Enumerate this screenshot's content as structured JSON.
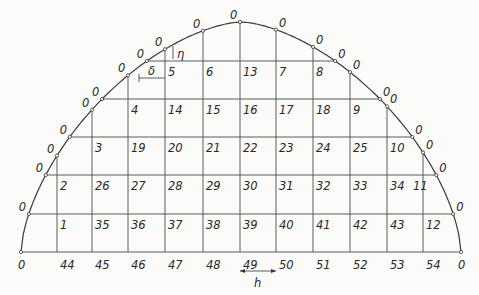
{
  "diagram": {
    "type": "grid-in-semi-elliptical-domain",
    "dimension_labels": {
      "horizontal_spacing": "h",
      "boundary_offset_x": "δ",
      "boundary_offset_y": "η"
    },
    "boundary_value": "0",
    "columns_x": [
      57,
      92,
      128,
      165,
      203,
      240,
      276,
      313,
      350,
      387,
      423
    ],
    "rows_y": [
      61,
      99,
      137,
      175,
      214,
      252
    ],
    "interior_rows": [
      {
        "y": 61,
        "labels": [
          {
            "x": 165,
            "t": "5"
          },
          {
            "x": 203,
            "t": "6"
          },
          {
            "x": 240,
            "t": "13"
          },
          {
            "x": 276,
            "t": "7"
          },
          {
            "x": 313,
            "t": "8"
          }
        ]
      },
      {
        "y": 99,
        "labels": [
          {
            "x": 128,
            "t": "4"
          },
          {
            "x": 165,
            "t": "14"
          },
          {
            "x": 203,
            "t": "15"
          },
          {
            "x": 240,
            "t": "16"
          },
          {
            "x": 276,
            "t": "17"
          },
          {
            "x": 313,
            "t": "18"
          },
          {
            "x": 350,
            "t": "9"
          }
        ]
      },
      {
        "y": 137,
        "labels": [
          {
            "x": 92,
            "t": "3"
          },
          {
            "x": 128,
            "t": "19"
          },
          {
            "x": 165,
            "t": "20"
          },
          {
            "x": 203,
            "t": "21"
          },
          {
            "x": 240,
            "t": "22"
          },
          {
            "x": 276,
            "t": "23"
          },
          {
            "x": 313,
            "t": "24"
          },
          {
            "x": 350,
            "t": "25"
          },
          {
            "x": 387,
            "t": "10"
          }
        ]
      },
      {
        "y": 175,
        "labels": [
          {
            "x": 57,
            "t": "2"
          },
          {
            "x": 92,
            "t": "26"
          },
          {
            "x": 128,
            "t": "27"
          },
          {
            "x": 165,
            "t": "28"
          },
          {
            "x": 203,
            "t": "29"
          },
          {
            "x": 240,
            "t": "30"
          },
          {
            "x": 276,
            "t": "31"
          },
          {
            "x": 313,
            "t": "32"
          },
          {
            "x": 350,
            "t": "33"
          },
          {
            "x": 387,
            "t": "34"
          },
          {
            "x": 410,
            "t": "11"
          }
        ]
      },
      {
        "y": 214,
        "labels": [
          {
            "x": 57,
            "t": "1"
          },
          {
            "x": 92,
            "t": "35"
          },
          {
            "x": 128,
            "t": "36"
          },
          {
            "x": 165,
            "t": "37"
          },
          {
            "x": 203,
            "t": "38"
          },
          {
            "x": 240,
            "t": "39"
          },
          {
            "x": 276,
            "t": "40"
          },
          {
            "x": 313,
            "t": "41"
          },
          {
            "x": 350,
            "t": "42"
          },
          {
            "x": 387,
            "t": "43"
          },
          {
            "x": 423,
            "t": "12"
          }
        ]
      },
      {
        "y": 252,
        "labels": [
          {
            "x": 57,
            "t": "44"
          },
          {
            "x": 92,
            "t": "45"
          },
          {
            "x": 128,
            "t": "46"
          },
          {
            "x": 165,
            "t": "47"
          },
          {
            "x": 203,
            "t": "48"
          },
          {
            "x": 240,
            "t": "49"
          },
          {
            "x": 276,
            "t": "50"
          },
          {
            "x": 313,
            "t": "51"
          },
          {
            "x": 350,
            "t": "52"
          },
          {
            "x": 387,
            "t": "53"
          },
          {
            "x": 423,
            "t": "54"
          }
        ]
      }
    ]
  }
}
